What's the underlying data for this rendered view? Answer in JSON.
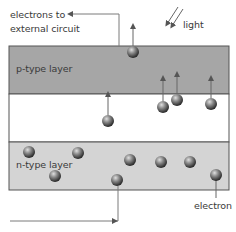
{
  "labels": {
    "electrons_to_line1": "electrons to",
    "electrons_to_line2": "external circuit",
    "light": "light",
    "p_layer": "p-type layer",
    "n_layer": "n-type layer",
    "electron": "electron"
  },
  "colors": {
    "p_layer_fill": "#a6a6a6",
    "n_layer_fill": "#d4d4d4",
    "junction_fill": "#ffffff",
    "border": "#555555",
    "wire": "#7a7a7a",
    "arrow": "#666666",
    "electron_light": "#c8c8c8",
    "electron_dark": "#3a3a3a"
  },
  "layers": {
    "x": 9,
    "width": 220,
    "p": {
      "y": 46,
      "height": 48
    },
    "junction": {
      "y": 94,
      "height": 48
    },
    "n": {
      "y": 142,
      "height": 48
    }
  },
  "electrons": {
    "top": [
      {
        "x": 133,
        "y": 52,
        "arrow_to": 24
      }
    ],
    "junction": [
      {
        "x": 108,
        "y": 121,
        "arrow_to": 92
      },
      {
        "x": 163,
        "y": 107,
        "arrow_to": 76
      },
      {
        "x": 177,
        "y": 100,
        "arrow_to": 72
      },
      {
        "x": 211,
        "y": 104,
        "arrow_to": 76
      }
    ],
    "n_layer": [
      {
        "x": 29,
        "y": 152
      },
      {
        "x": 78,
        "y": 153
      },
      {
        "x": 55,
        "y": 176
      },
      {
        "x": 130,
        "y": 160
      },
      {
        "x": 161,
        "y": 162
      },
      {
        "x": 190,
        "y": 162
      },
      {
        "x": 117,
        "y": 180
      },
      {
        "x": 216,
        "y": 175
      }
    ]
  }
}
